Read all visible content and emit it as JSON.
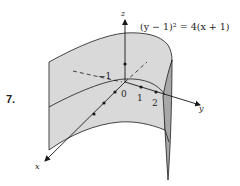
{
  "figure": {
    "number_label": "7.",
    "equation": "(y − 1)² = 4(x + 1)",
    "axes": {
      "x_label": "x",
      "y_label": "y",
      "z_label": "z"
    },
    "tick_labels": {
      "origin": "0",
      "y_tick_1": "1",
      "y_tick_2": "2",
      "neg_one": "−1"
    },
    "colors": {
      "surface_fill": "#d9d9d9",
      "surface_edge_fill": "#a8a8a8",
      "line": "#1a1a1a",
      "background": "#ffffff"
    }
  }
}
